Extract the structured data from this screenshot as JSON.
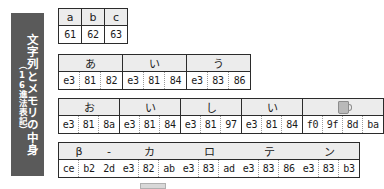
{
  "caption": {
    "main_text": "文字列とメモリの中身",
    "sub_text": "（16進法表記）",
    "background_color": "#5a5a5a",
    "text_color": "#ffffff"
  },
  "colors": {
    "border": "#2b2b2b",
    "char_row_background": "#ececec",
    "byte_row_background": "#ffffff",
    "byte_divider": "#9a9a9a",
    "page_background": "#ffffff"
  },
  "tables": [
    {
      "id": "ascii-abc",
      "groups": [
        {
          "char": "a",
          "bytes": [
            "61"
          ]
        },
        {
          "char": "b",
          "bytes": [
            "62"
          ]
        },
        {
          "char": "c",
          "bytes": [
            "63"
          ]
        }
      ]
    },
    {
      "id": "hiragana-aiu",
      "groups": [
        {
          "char": "あ",
          "bytes": [
            "e3",
            "81",
            "82"
          ]
        },
        {
          "char": "い",
          "bytes": [
            "e3",
            "81",
            "84"
          ]
        },
        {
          "char": "う",
          "bytes": [
            "e3",
            "83",
            "86"
          ]
        }
      ]
    },
    {
      "id": "oishii-emoji",
      "groups": [
        {
          "char": "お",
          "bytes": [
            "e3",
            "81",
            "8a"
          ]
        },
        {
          "char": "い",
          "bytes": [
            "e3",
            "81",
            "84"
          ]
        },
        {
          "char": "し",
          "bytes": [
            "e3",
            "81",
            "97"
          ]
        },
        {
          "char": "い",
          "bytes": [
            "e3",
            "81",
            "84"
          ]
        },
        {
          "char": "🍺",
          "char_kind": "emoji-beer-mug",
          "bytes": [
            "f0",
            "9f",
            "8d",
            "ba"
          ]
        }
      ]
    },
    {
      "id": "beta-karaten",
      "groups": [
        {
          "char": "β",
          "bytes": [
            "ce",
            "b2"
          ]
        },
        {
          "char": "-",
          "bytes": [
            "2d"
          ]
        },
        {
          "char": "カ",
          "bytes": [
            "e3",
            "82",
            "ab"
          ]
        },
        {
          "char": "ロ",
          "bytes": [
            "e3",
            "83",
            "ad"
          ]
        },
        {
          "char": "テ",
          "bytes": [
            "e3",
            "83",
            "86"
          ]
        },
        {
          "char": "ン",
          "bytes": [
            "e3",
            "83",
            "b3"
          ]
        }
      ]
    }
  ]
}
